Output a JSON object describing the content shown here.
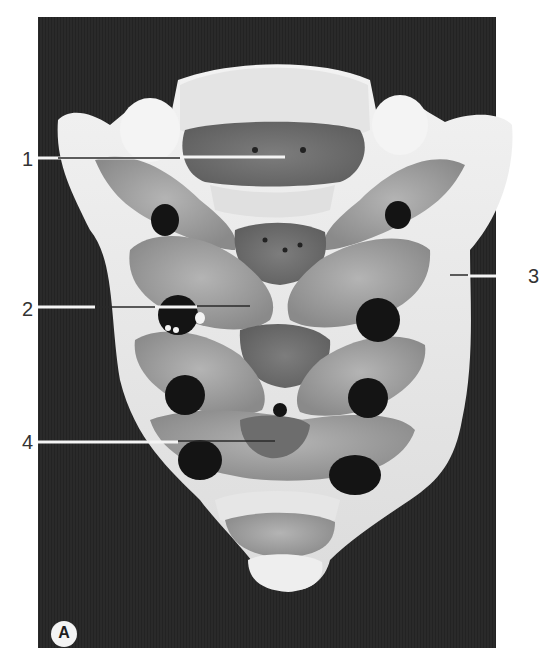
{
  "figure": {
    "panel_letter": "A",
    "colors": {
      "background": "#ffffff",
      "panel": "#2a2a2a",
      "bone_light": "#ededed",
      "bone_mid": "#a9a9a9",
      "bone_dark": "#7a7a7a",
      "foramen": "#141414",
      "label_text": "#333333"
    }
  },
  "labels": [
    {
      "id": "1",
      "text": "1",
      "x": 22,
      "y": 151
    },
    {
      "id": "2",
      "text": "2",
      "x": 22,
      "y": 301
    },
    {
      "id": "3",
      "text": "3",
      "x": 526,
      "y": 267
    },
    {
      "id": "4",
      "text": "4",
      "x": 22,
      "y": 434
    }
  ]
}
